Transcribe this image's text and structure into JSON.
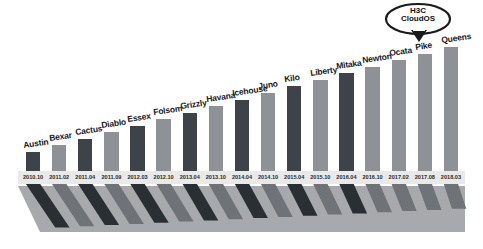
{
  "callout": {
    "name": "h3c-cloudos-badge",
    "line1": "H3C",
    "line2": "CloudOS",
    "points_at": "Pike"
  },
  "colors": {
    "bar_dark": "#3d4349",
    "bar_gray": "#8e9195",
    "bar_dark_shadow": "#2a2f34",
    "bar_gray_shadow": "#6f7377",
    "wedge": "#a7a9ac",
    "background": "#ffffff",
    "axis_strip": "#e9e9e9",
    "label_text": "#1b1b1b",
    "tick_text": "#2a2a2a"
  },
  "chart_data": {
    "type": "bar",
    "title": "",
    "subtitle": "",
    "xlabel": "",
    "ylabel": "",
    "grid": false,
    "legend": "none",
    "ylim": [
      0,
      20
    ],
    "categories": [
      "2010.10",
      "2011.02",
      "2011.04",
      "2011.09",
      "2012.03",
      "2012.10",
      "2013.04",
      "2013.10",
      "2014.04",
      "2014.10",
      "2015.04",
      "2015.10",
      "2016.04",
      "2016.10",
      "2017.02",
      "2017.08",
      "2018.03",
      "2018.03"
    ],
    "point_labels": [
      "Austin",
      "Bexar",
      "Cactus",
      "Diablo",
      "Essex",
      "Folsom",
      "Grizzly",
      "Havana",
      "Icehouse",
      "Juno",
      "Kilo",
      "Liberty",
      "Mitaka",
      "Newton",
      "Ocata",
      "Pike",
      "Queens",
      "Queens"
    ],
    "values": [
      1,
      2,
      3,
      4,
      5,
      6,
      7,
      8,
      9,
      10,
      11,
      12,
      13,
      14,
      15,
      16,
      17,
      17
    ],
    "series": [
      {
        "name": "Release",
        "values": [
          1,
          2,
          3,
          4,
          5,
          6,
          7,
          8,
          9,
          10,
          11,
          12,
          13,
          14,
          15,
          16,
          17,
          17
        ]
      }
    ],
    "bars": [
      {
        "label": "Austin",
        "tick": "2010.10",
        "value": 1,
        "shade": "dark"
      },
      {
        "label": "Bexar",
        "tick": "2011.02",
        "value": 2,
        "shade": "gray"
      },
      {
        "label": "Cactus",
        "tick": "2011.04",
        "value": 3,
        "shade": "dark"
      },
      {
        "label": "Diablo",
        "tick": "2011.09",
        "value": 4,
        "shade": "gray"
      },
      {
        "label": "Essex",
        "tick": "2012.03",
        "value": 5,
        "shade": "dark"
      },
      {
        "label": "Folsom",
        "tick": "2012.10",
        "value": 6,
        "shade": "gray"
      },
      {
        "label": "Grizzly",
        "tick": "2013.04",
        "value": 7,
        "shade": "dark"
      },
      {
        "label": "Havana",
        "tick": "2013.10",
        "value": 8,
        "shade": "gray"
      },
      {
        "label": "Icehouse",
        "tick": "2014.04",
        "value": 9,
        "shade": "dark"
      },
      {
        "label": "Juno",
        "tick": "2014.10",
        "value": 10,
        "shade": "gray"
      },
      {
        "label": "Kilo",
        "tick": "2015.04",
        "value": 11,
        "shade": "dark"
      },
      {
        "label": "Liberty",
        "tick": "2015.10",
        "value": 12,
        "shade": "gray"
      },
      {
        "label": "Mitaka",
        "tick": "2016.04",
        "value": 13,
        "shade": "dark"
      },
      {
        "label": "Newton",
        "tick": "2016.10",
        "value": 14,
        "shade": "gray"
      },
      {
        "label": "Ocata",
        "tick": "2017.02",
        "value": 15,
        "shade": "gray"
      },
      {
        "label": "Pike",
        "tick": "2017.08",
        "value": 16,
        "shade": "gray"
      },
      {
        "label": "Queens",
        "tick": "2018.03",
        "value": 17,
        "shade": "gray"
      }
    ]
  }
}
